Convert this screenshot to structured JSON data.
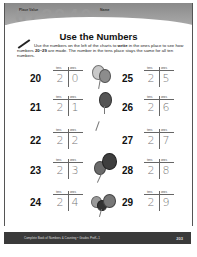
{
  "header": {
    "left_label": "Place Value",
    "right_label": "Name",
    "bg_numbers": "672940"
  },
  "title": "Use the Numbers",
  "instructions": {
    "pre": "Use the numbers on the left of the charts to ",
    "bold": "write",
    "mid": " in the ones place to see how numbers ",
    "range": "20–29",
    "post": " are made. The number in the tens place stays the same for all ten numbers."
  },
  "chart_headers": {
    "tens": "tens",
    "ones": "ones"
  },
  "left_rows": [
    {
      "number": "20",
      "tens": "2",
      "ones": "0"
    },
    {
      "number": "21",
      "tens": "2",
      "ones": "1"
    },
    {
      "number": "22",
      "tens": "2",
      "ones": "2"
    },
    {
      "number": "23",
      "tens": "2",
      "ones": "3"
    },
    {
      "number": "24",
      "tens": "2",
      "ones": "4"
    }
  ],
  "right_rows": [
    {
      "number": "25",
      "tens": "2",
      "ones": "5"
    },
    {
      "number": "26",
      "tens": "2",
      "ones": "6"
    },
    {
      "number": "27",
      "tens": "2",
      "ones": "7"
    },
    {
      "number": "28",
      "tens": "2",
      "ones": "8"
    },
    {
      "number": "29",
      "tens": "2",
      "ones": "9"
    }
  ],
  "footer": {
    "text": "Complete Book of Numbers & Counting • Grades PreK–1",
    "page": "203"
  }
}
